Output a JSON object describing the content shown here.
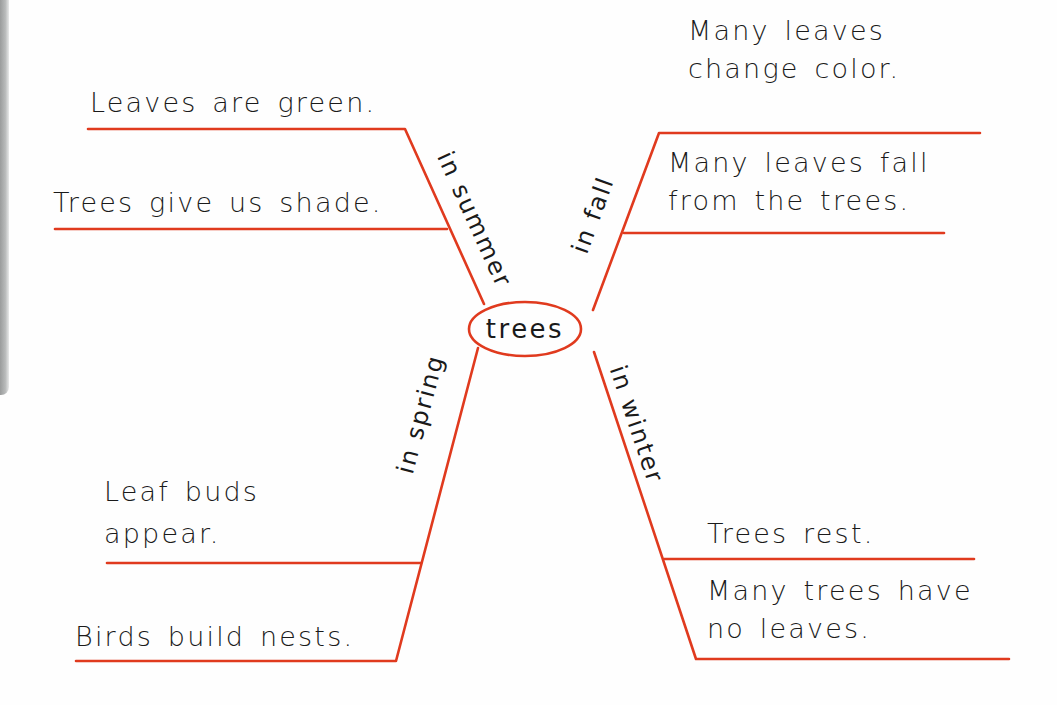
{
  "diagram": {
    "type": "concept-web",
    "center": {
      "label": "trees"
    },
    "colors": {
      "line": "#e03a1e",
      "text": "#1a1a1a",
      "background": "#fefefe"
    },
    "branches": [
      {
        "label": "in summer",
        "facts": [
          "Leaves are green.",
          "Trees give us shade."
        ]
      },
      {
        "label": "in fall",
        "facts": [
          {
            "line1": "Many leaves",
            "line2": "change color."
          },
          {
            "line1": "Many leaves fall",
            "line2": "from the trees."
          }
        ]
      },
      {
        "label": "in spring",
        "facts": [
          {
            "line1": "Leaf buds",
            "line2": "appear."
          },
          "Birds build nests."
        ]
      },
      {
        "label": "in winter",
        "facts": [
          "Trees rest.",
          {
            "line1": "Many trees have",
            "line2": "no leaves."
          }
        ]
      }
    ]
  }
}
